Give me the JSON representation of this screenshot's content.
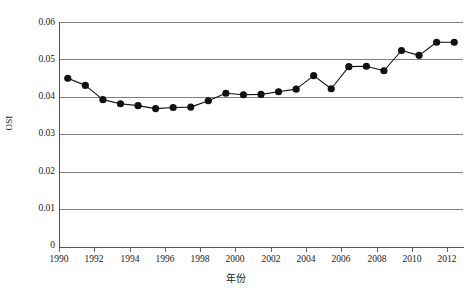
{
  "chart_data": {
    "type": "line",
    "title": "",
    "xlabel": "年份",
    "ylabel": "OSI",
    "xlim": [
      1989.5,
      2012.5
    ],
    "ylim": [
      0,
      0.06
    ],
    "grid": true,
    "legend": null,
    "marker": "filled-circle",
    "line_color": "#111111",
    "grid_color": "#808080",
    "y_ticks": [
      "0",
      "0.01",
      "0.02",
      "0.03",
      "0.04",
      "0.05",
      "0.06"
    ],
    "y_tick_values": [
      0,
      0.01,
      0.02,
      0.03,
      0.04,
      0.05,
      0.06
    ],
    "x_ticks": [
      "1990",
      "1992",
      "1994",
      "1996",
      "1998",
      "2000",
      "2002",
      "2004",
      "2006",
      "2008",
      "2010",
      "2012"
    ],
    "x_tick_values": [
      1990,
      1992,
      1994,
      1996,
      1998,
      2000,
      2002,
      2004,
      2006,
      2008,
      2010,
      2012
    ],
    "x": [
      1990,
      1991,
      1992,
      1993,
      1994,
      1995,
      1996,
      1997,
      1998,
      1999,
      2000,
      2001,
      2002,
      2003,
      2004,
      2005,
      2006,
      2007,
      2008,
      2009,
      2010,
      2011,
      2012
    ],
    "values": [
      0.045,
      0.0431,
      0.0393,
      0.0382,
      0.0377,
      0.0369,
      0.0372,
      0.0373,
      0.039,
      0.041,
      0.0406,
      0.0407,
      0.0414,
      0.0421,
      0.0457,
      0.0422,
      0.0481,
      0.0482,
      0.047,
      0.0524,
      0.0511,
      0.0546,
      0.0546
    ],
    "series": [
      {
        "name": "OSI",
        "values": [
          0.045,
          0.0431,
          0.0393,
          0.0382,
          0.0377,
          0.0369,
          0.0372,
          0.0373,
          0.039,
          0.041,
          0.0406,
          0.0407,
          0.0414,
          0.0421,
          0.0457,
          0.0422,
          0.0481,
          0.0482,
          0.047,
          0.0524,
          0.0511,
          0.0546,
          0.0546
        ]
      }
    ]
  }
}
